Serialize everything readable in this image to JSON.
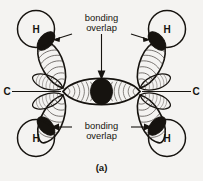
{
  "figure": {
    "caption": "(a)",
    "background_color": "#f4f3f1",
    "ink_color": "#16130f",
    "contour_color": "#55504b",
    "atoms": {
      "hydrogen_label": "H",
      "carbon_label": "C",
      "hydrogen_positions": [
        "top-left",
        "top-right",
        "bottom-left",
        "bottom-right"
      ],
      "carbon_positions": [
        "left",
        "right"
      ]
    },
    "annotations": [
      {
        "line1": "bonding",
        "line2": "overlap",
        "position": "top"
      },
      {
        "line1": "bonding",
        "line2": "overlap",
        "position": "bottom"
      }
    ],
    "labels": {
      "h_top_left": "H",
      "h_top_right": "H",
      "h_bottom_left": "H",
      "h_bottom_right": "H",
      "c_left": "C",
      "c_right": "C"
    }
  }
}
